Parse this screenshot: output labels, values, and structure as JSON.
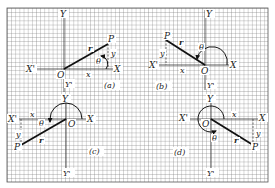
{
  "figure": {
    "colors": {
      "grid": "#7a7a7a",
      "ink": "#111111",
      "background": "#ffffff"
    },
    "panels": [
      {
        "id": "a",
        "caption": "(a)",
        "quadrant": "I",
        "labels": {
          "y_axis": "Y",
          "y_axis_neg": "Y'",
          "x_axis": "X",
          "x_axis_neg": "X'",
          "origin": "O",
          "point": "P",
          "radius": "r",
          "angle": "θ",
          "x": "x",
          "y": "y"
        }
      },
      {
        "id": "b",
        "caption": "(b)",
        "quadrant": "II",
        "labels": {
          "y_axis": "Y",
          "y_axis_neg": "Y'",
          "x_axis": "X",
          "x_axis_neg": "X'",
          "origin": "O",
          "point": "P",
          "radius": "r",
          "angle": "θ",
          "x": "x",
          "y": "y"
        }
      },
      {
        "id": "c",
        "caption": "(c)",
        "quadrant": "III",
        "labels": {
          "y_axis": "Y",
          "y_axis_neg": "Y'",
          "x_axis": "X",
          "x_axis_neg": "X'",
          "origin": "O",
          "point": "P",
          "radius": "r",
          "angle": "θ",
          "x": "x",
          "y": "y"
        }
      },
      {
        "id": "d",
        "caption": "(d)",
        "quadrant": "IV",
        "labels": {
          "y_axis": "Y",
          "y_axis_neg": "Y'",
          "x_axis": "X",
          "x_axis_neg": "X'",
          "origin": "O",
          "point": "P",
          "radius": "r",
          "angle": "θ",
          "x": "x",
          "y": "y"
        }
      }
    ]
  }
}
